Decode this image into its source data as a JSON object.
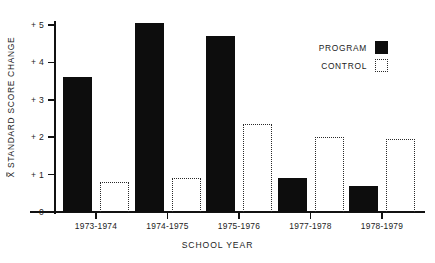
{
  "chart_data": {
    "type": "bar",
    "title": "",
    "xlabel": "SCHOOL YEAR",
    "ylabel": "X̄ STANDARD SCORE CHANGE",
    "ylabel_prefix": "X",
    "ylabel_rest": " STANDARD SCORE CHANGE",
    "categories": [
      "1973-1974",
      "1974-1975",
      "1975-1976",
      "1977-1978",
      "1978-1979"
    ],
    "series": [
      {
        "name": "PROGRAM",
        "values": [
          3.6,
          5.05,
          4.7,
          0.9,
          0.7
        ],
        "style": "solid-black",
        "color": "#0d0d0d"
      },
      {
        "name": "CONTROL",
        "values": [
          0.8,
          0.9,
          2.35,
          2.0,
          1.95
        ],
        "style": "dotted-outline",
        "color": "#2a2a2a"
      }
    ],
    "ylim": [
      0,
      5.35
    ],
    "yticks": [
      0,
      1,
      2,
      3,
      4,
      5
    ],
    "ytick_labels": [
      "0",
      "+ 1",
      "+ 2",
      "+ 3",
      "+ 4",
      "+ 5"
    ],
    "grid": false,
    "legend_position": "top-right"
  },
  "legend": {
    "entries": [
      {
        "label": "PROGRAM",
        "swatch": "solid-black-square"
      },
      {
        "label": "CONTROL",
        "swatch": "dotted-outline-square"
      }
    ]
  }
}
